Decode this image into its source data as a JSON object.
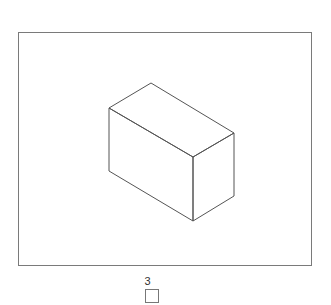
{
  "figure": {
    "shape": "rectangular-prism-isometric",
    "stroke_color": "#555555",
    "frame_color": "#7a7a7a",
    "vertices": {
      "top": [
        151,
        83
      ],
      "left_top": [
        109,
        108
      ],
      "front_corner": [
        193,
        157
      ],
      "right_top": [
        234,
        133
      ],
      "left_bottom": [
        109,
        171
      ],
      "bottom": [
        193,
        221
      ],
      "right_bottom": [
        234,
        196
      ]
    }
  },
  "option": {
    "label": "3",
    "checked": false
  }
}
